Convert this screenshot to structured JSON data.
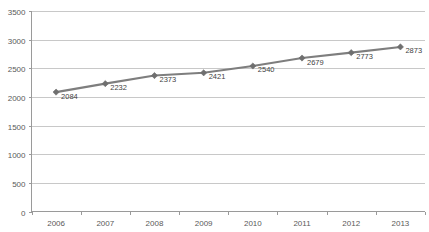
{
  "chart_data": {
    "type": "line",
    "title": "",
    "title_note": "title row clipped at top edge of screenshot",
    "xlabel": "",
    "ylabel": "",
    "categories": [
      "2006",
      "2007",
      "2008",
      "2009",
      "2010",
      "2011",
      "2012",
      "2013"
    ],
    "series": [
      {
        "name": "",
        "values": [
          2084,
          2232,
          2373,
          2421,
          2540,
          2679,
          2773,
          2873
        ]
      }
    ],
    "data_labels": [
      "2084",
      "2232",
      "2373",
      "2421",
      "2540",
      "2679",
      "2773",
      "2873"
    ],
    "ylim": [
      0,
      3500
    ],
    "ytick_step": 500,
    "ytick_labels": [
      "0",
      "500",
      "1000",
      "1500",
      "2000",
      "2500",
      "3000",
      "3500"
    ],
    "xtick_labels": [
      "2006",
      "2007",
      "2008",
      "2009",
      "2010",
      "2011",
      "2012",
      "2013"
    ],
    "grid": true,
    "grid_axis": "y",
    "legend": false,
    "legend_position": "none",
    "marker": "diamond",
    "colors": {
      "line": "#7e7e7e",
      "marker": "#6f6f6f",
      "gridline": "#c8c8c8",
      "axis": "#9a9a9a",
      "tick_text": "#595959",
      "label_text": "#3f3f3f",
      "background": "#ffffff"
    }
  }
}
